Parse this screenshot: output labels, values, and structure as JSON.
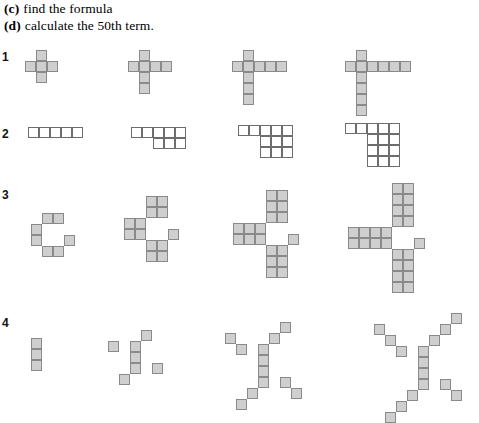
{
  "instructions": [
    {
      "tag": "(c)",
      "text": "find the formula"
    },
    {
      "tag": "(d)",
      "text": "calculate the 50th term."
    }
  ],
  "style": {
    "shaded_fill": "#cfcfcf",
    "shaded_stroke": "#8a8a8a",
    "plain_fill": "#ffffff",
    "plain_stroke": "#6d6d6d",
    "background": "#ffffff"
  },
  "rows": [
    {
      "label": "1",
      "label_x": 2,
      "label_y": 50,
      "cell": 11,
      "fill": "shaded",
      "figures": [
        {
          "name": "row1-term1",
          "x": 25,
          "y": 50,
          "cells": [
            [
              1,
              0
            ],
            [
              0,
              1
            ],
            [
              1,
              1
            ],
            [
              2,
              1
            ],
            [
              1,
              2
            ]
          ]
        },
        {
          "name": "row1-term2",
          "x": 128,
          "y": 50,
          "cells": [
            [
              1,
              0
            ],
            [
              0,
              1
            ],
            [
              1,
              1
            ],
            [
              2,
              1
            ],
            [
              3,
              1
            ],
            [
              1,
              2
            ],
            [
              1,
              3
            ]
          ]
        },
        {
          "name": "row1-term3",
          "x": 232,
          "y": 50,
          "cells": [
            [
              1,
              0
            ],
            [
              0,
              1
            ],
            [
              1,
              1
            ],
            [
              2,
              1
            ],
            [
              3,
              1
            ],
            [
              4,
              1
            ],
            [
              1,
              2
            ],
            [
              1,
              3
            ],
            [
              1,
              4
            ]
          ]
        },
        {
          "name": "row1-term4",
          "x": 345,
          "y": 50,
          "cells": [
            [
              1,
              0
            ],
            [
              0,
              1
            ],
            [
              1,
              1
            ],
            [
              2,
              1
            ],
            [
              3,
              1
            ],
            [
              4,
              1
            ],
            [
              5,
              1
            ],
            [
              1,
              2
            ],
            [
              1,
              3
            ],
            [
              1,
              4
            ],
            [
              1,
              5
            ]
          ]
        }
      ]
    },
    {
      "label": "2",
      "label_x": 2,
      "label_y": 127,
      "cell": 11,
      "fill": "plain",
      "figures": [
        {
          "name": "row2-term1",
          "x": 28,
          "y": 127,
          "cells": [
            [
              0,
              0
            ],
            [
              1,
              0
            ],
            [
              2,
              0
            ],
            [
              3,
              0
            ],
            [
              4,
              0
            ]
          ]
        },
        {
          "name": "row2-term2",
          "x": 131,
          "y": 127,
          "cells": [
            [
              0,
              0
            ],
            [
              1,
              0
            ],
            [
              2,
              0
            ],
            [
              3,
              0
            ],
            [
              4,
              0
            ],
            [
              2,
              1
            ],
            [
              3,
              1
            ],
            [
              4,
              1
            ]
          ]
        },
        {
          "name": "row2-term3",
          "x": 238,
          "y": 125,
          "cells": [
            [
              0,
              0
            ],
            [
              1,
              0
            ],
            [
              2,
              0
            ],
            [
              3,
              0
            ],
            [
              4,
              0
            ],
            [
              2,
              1
            ],
            [
              3,
              1
            ],
            [
              4,
              1
            ],
            [
              2,
              2
            ],
            [
              3,
              2
            ],
            [
              4,
              2
            ]
          ]
        },
        {
          "name": "row2-term4",
          "x": 345,
          "y": 123,
          "cells": [
            [
              0,
              0
            ],
            [
              1,
              0
            ],
            [
              2,
              0
            ],
            [
              3,
              0
            ],
            [
              4,
              0
            ],
            [
              2,
              1
            ],
            [
              3,
              1
            ],
            [
              4,
              1
            ],
            [
              2,
              2
            ],
            [
              3,
              2
            ],
            [
              4,
              2
            ],
            [
              2,
              3
            ],
            [
              3,
              3
            ],
            [
              4,
              3
            ]
          ]
        }
      ]
    },
    {
      "label": "3",
      "label_x": 2,
      "label_y": 188,
      "cell": 11,
      "fill": "shaded",
      "figures": [
        {
          "name": "row3-term1",
          "x": 31,
          "y": 213,
          "cells": [
            [
              1,
              0
            ],
            [
              2,
              0
            ],
            [
              0,
              1
            ],
            [
              0,
              2
            ],
            [
              3,
              2
            ],
            [
              1,
              3
            ],
            [
              2,
              3
            ]
          ]
        },
        {
          "name": "row3-term2",
          "x": 124,
          "y": 196,
          "cells": [
            [
              2,
              0
            ],
            [
              3,
              0
            ],
            [
              2,
              1
            ],
            [
              3,
              1
            ],
            [
              0,
              2
            ],
            [
              1,
              2
            ],
            [
              0,
              3
            ],
            [
              1,
              3
            ],
            [
              4,
              3
            ],
            [
              2,
              4
            ],
            [
              3,
              4
            ],
            [
              2,
              5
            ],
            [
              3,
              5
            ]
          ]
        },
        {
          "name": "row3-term3",
          "x": 233,
          "y": 190,
          "cells": [
            [
              3,
              0
            ],
            [
              4,
              0
            ],
            [
              3,
              1
            ],
            [
              4,
              1
            ],
            [
              3,
              2
            ],
            [
              4,
              2
            ],
            [
              0,
              3
            ],
            [
              1,
              3
            ],
            [
              2,
              3
            ],
            [
              0,
              4
            ],
            [
              1,
              4
            ],
            [
              2,
              4
            ],
            [
              5,
              4
            ],
            [
              3,
              5
            ],
            [
              4,
              5
            ],
            [
              3,
              6
            ],
            [
              4,
              6
            ],
            [
              3,
              7
            ],
            [
              4,
              7
            ]
          ]
        },
        {
          "name": "row3-term4",
          "x": 348,
          "y": 183,
          "cells": [
            [
              4,
              0
            ],
            [
              5,
              0
            ],
            [
              4,
              1
            ],
            [
              5,
              1
            ],
            [
              4,
              2
            ],
            [
              5,
              2
            ],
            [
              4,
              3
            ],
            [
              5,
              3
            ],
            [
              0,
              4
            ],
            [
              1,
              4
            ],
            [
              2,
              4
            ],
            [
              3,
              4
            ],
            [
              0,
              5
            ],
            [
              1,
              5
            ],
            [
              2,
              5
            ],
            [
              3,
              5
            ],
            [
              6,
              5
            ],
            [
              4,
              6
            ],
            [
              5,
              6
            ],
            [
              4,
              7
            ],
            [
              5,
              7
            ],
            [
              4,
              8
            ],
            [
              5,
              8
            ],
            [
              4,
              9
            ],
            [
              5,
              9
            ]
          ]
        }
      ]
    },
    {
      "label": "4",
      "label_x": 2,
      "label_y": 316,
      "cell": 11,
      "fill": "shaded",
      "figures": [
        {
          "name": "row4-term1",
          "x": 31,
          "y": 338,
          "cells": [
            [
              0,
              0
            ],
            [
              0,
              1
            ],
            [
              0,
              2
            ]
          ]
        },
        {
          "name": "row4-term2",
          "x": 108,
          "y": 330,
          "cells": [
            [
              3,
              0
            ],
            [
              0,
              1
            ],
            [
              2,
              1
            ],
            [
              2,
              2
            ],
            [
              2,
              3
            ],
            [
              4,
              3
            ],
            [
              1,
              4
            ]
          ]
        },
        {
          "name": "row4-term3",
          "x": 225,
          "y": 322,
          "cells": [
            [
              5,
              0
            ],
            [
              0,
              1
            ],
            [
              4,
              1
            ],
            [
              1,
              2
            ],
            [
              3,
              2
            ],
            [
              3,
              3
            ],
            [
              3,
              4
            ],
            [
              3,
              5
            ],
            [
              5,
              5
            ],
            [
              2,
              6
            ],
            [
              6,
              6
            ],
            [
              1,
              7
            ]
          ]
        },
        {
          "name": "row4-term4",
          "x": 374,
          "y": 313,
          "cells": [
            [
              7,
              0
            ],
            [
              0,
              1
            ],
            [
              6,
              1
            ],
            [
              1,
              2
            ],
            [
              5,
              2
            ],
            [
              2,
              3
            ],
            [
              4,
              3
            ],
            [
              4,
              4
            ],
            [
              4,
              5
            ],
            [
              4,
              6
            ],
            [
              6,
              6
            ],
            [
              3,
              7
            ],
            [
              7,
              7
            ],
            [
              2,
              8
            ],
            [
              1,
              9
            ]
          ]
        }
      ]
    }
  ]
}
